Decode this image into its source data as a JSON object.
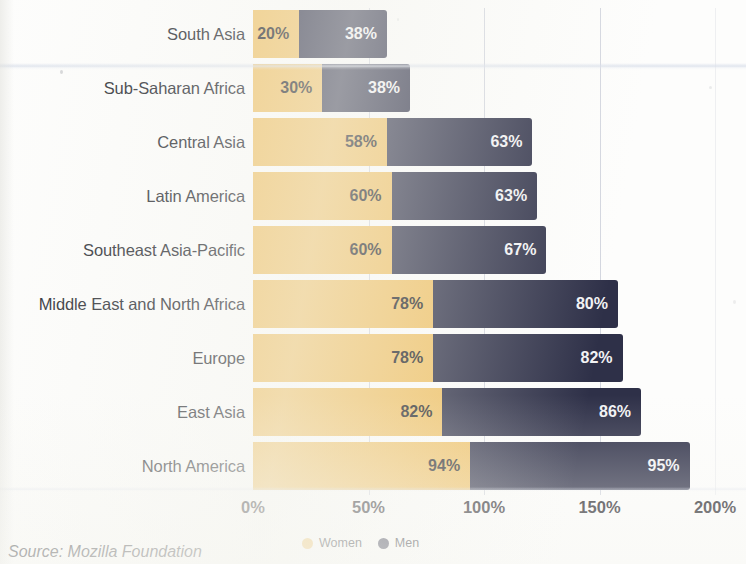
{
  "chart_data": {
    "type": "bar",
    "subtype": "stacked-horizontal-bar",
    "title": "",
    "xlabel": "",
    "ylabel": "",
    "xlim": [
      0,
      200
    ],
    "xtick_labels": [
      "0%",
      "50%",
      "100%",
      "150%",
      "200%"
    ],
    "xticks": [
      0,
      50,
      100,
      150,
      200
    ],
    "grid": true,
    "grid_axis": "x",
    "legend_position": "bottom-center",
    "categories": [
      "South Asia",
      "Sub-Saharan Africa",
      "Central Asia",
      "Latin America",
      "Southeast Asia-Pacific",
      "Middle East and North Africa",
      "Europe",
      "East Asia",
      "North America"
    ],
    "series": [
      {
        "name": "Women",
        "color": "#efc063",
        "values": [
          20,
          30,
          58,
          60,
          60,
          78,
          78,
          82,
          94
        ],
        "labels": [
          "20%",
          "30%",
          "58%",
          "60%",
          "60%",
          "78%",
          "78%",
          "82%",
          "94%"
        ]
      },
      {
        "name": "Men",
        "color": "#2e3048",
        "values": [
          38,
          38,
          63,
          63,
          67,
          80,
          82,
          86,
          95
        ],
        "labels": [
          "38%",
          "38%",
          "63%",
          "63%",
          "67%",
          "80%",
          "82%",
          "86%",
          "95%"
        ]
      }
    ],
    "source_note": "Source: Mozilla Foundation"
  },
  "legend": {
    "items": [
      {
        "label": "Women",
        "color": "#efc063"
      },
      {
        "label": "Men",
        "color": "#2e3048"
      }
    ]
  },
  "colors": {
    "women": "#efc063",
    "men": "#2e3048",
    "background": "#fdfdfc",
    "text": "#22242b",
    "gridline": "#b0b6c6"
  }
}
